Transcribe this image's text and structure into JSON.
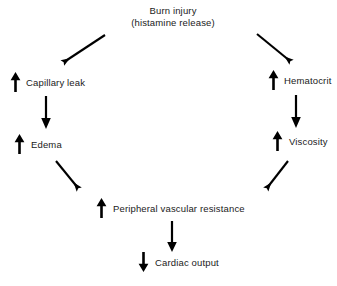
{
  "diagram": {
    "title": {
      "line1": "Burn injury",
      "line2": "(histamine release)"
    },
    "ink_color": "#000000",
    "background_color": "#ffffff",
    "nodes": [
      {
        "id": "capillary-leak",
        "label": "Capillary leak",
        "trend": "up",
        "trend_glyph": "↑"
      },
      {
        "id": "edema",
        "label": "Edema",
        "trend": "up",
        "trend_glyph": "↑"
      },
      {
        "id": "hematocrit",
        "label": "Hematocrit",
        "trend": "up",
        "trend_glyph": "↑"
      },
      {
        "id": "viscosity",
        "label": "Viscosity",
        "trend": "up",
        "trend_glyph": "↑"
      },
      {
        "id": "peripheral-vascular-resistance",
        "label": "Peripheral vascular resistance",
        "trend": "up",
        "trend_glyph": "↑"
      },
      {
        "id": "cardiac-output",
        "label": "Cardiac output",
        "trend": "down",
        "trend_glyph": "↓"
      }
    ],
    "connectors": [
      {
        "id": "burn-to-capillary-leak",
        "from": "Burn injury",
        "to": "Capillary leak",
        "direction": "down-left"
      },
      {
        "id": "burn-to-hematocrit",
        "from": "Burn injury",
        "to": "Hematocrit",
        "direction": "down-right"
      },
      {
        "id": "capillary-leak-to-edema",
        "from": "Capillary leak",
        "to": "Edema",
        "direction": "down"
      },
      {
        "id": "hematocrit-to-viscosity",
        "from": "Hematocrit",
        "to": "Viscosity",
        "direction": "down"
      },
      {
        "id": "edema-to-pvr",
        "from": "Edema",
        "to": "Peripheral vascular resistance",
        "direction": "down-right"
      },
      {
        "id": "viscosity-to-pvr",
        "from": "Viscosity",
        "to": "Peripheral vascular resistance",
        "direction": "down-left"
      },
      {
        "id": "pvr-to-cardiac-output",
        "from": "Peripheral vascular resistance",
        "to": "Cardiac output",
        "direction": "down"
      }
    ]
  }
}
